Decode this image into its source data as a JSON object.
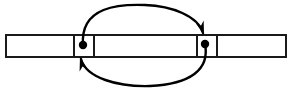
{
  "figure": {
    "background_color": "#ffffff",
    "stroke_color": "#1a1a1a",
    "cell_fill_color": "#ffffff",
    "line_color": "#000000",
    "width": 293,
    "height": 98
  },
  "array_bar": {
    "name": "horizontal-array-bar",
    "x": 5,
    "y": 34,
    "width": 282,
    "height": 24,
    "border_width": 2,
    "divider_width": 2,
    "divider_positions": [
      73,
      93,
      196,
      216
    ],
    "cells": [
      {
        "index": 0,
        "x": 5,
        "width": 68,
        "label": ""
      },
      {
        "index": 1,
        "x": 73,
        "width": 20,
        "label": ""
      },
      {
        "index": 2,
        "x": 93,
        "width": 103,
        "label": ""
      },
      {
        "index": 3,
        "x": 196,
        "width": 20,
        "label": ""
      },
      {
        "index": 4,
        "x": 216,
        "width": 71,
        "label": ""
      }
    ],
    "cell_count": 5
  },
  "markers": [
    {
      "name": "left-marker-dot",
      "cx": 83,
      "cy": 45,
      "r": 4.2,
      "color": "#000000"
    },
    {
      "name": "right-marker-dot",
      "cx": 205,
      "cy": 44,
      "r": 4.2,
      "color": "#000000"
    }
  ],
  "arrows": [
    {
      "name": "top-arc-arrow-left-to-right",
      "direction": "left-to-right",
      "path": "M 83 45 C 80 6, 120 4, 145 5 C 172 6, 198 16, 203 33",
      "stroke_width": 2.4,
      "color": "#000000",
      "arrowhead": {
        "name": "top-arrowhead",
        "tip_x": 204,
        "tip_y": 35,
        "angle_deg": 72,
        "length": 14,
        "half_width": 4.2
      }
    },
    {
      "name": "bottom-arc-arrow-right-to-left",
      "direction": "right-to-left",
      "path": "M 205 44 C 210 70, 190 84, 150 86 C 118 87, 86 78, 81 59",
      "stroke_width": 2.4,
      "color": "#000000",
      "arrowhead": {
        "name": "bottom-arrowhead",
        "tip_x": 80,
        "tip_y": 57,
        "angle_deg": 255,
        "length": 14,
        "half_width": 4.2
      }
    }
  ]
}
